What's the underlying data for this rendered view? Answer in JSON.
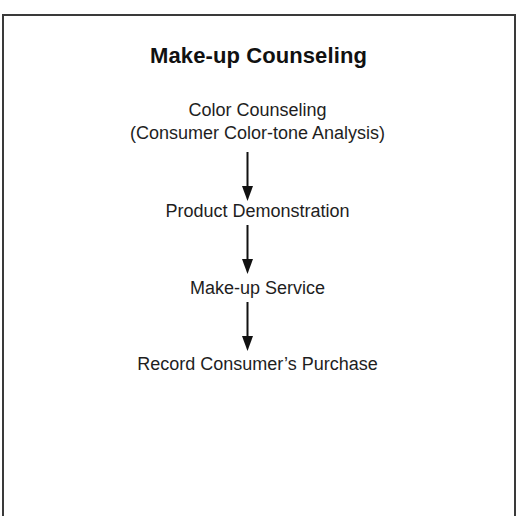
{
  "diagram": {
    "title": "Make-up Counseling",
    "steps": [
      {
        "lines": [
          "Color Counseling",
          "(Consumer Color-tone Analysis)"
        ]
      },
      {
        "lines": [
          "Product Demonstration"
        ]
      },
      {
        "lines": [
          "Make-up Service"
        ]
      },
      {
        "lines": [
          "Record Consumer’s Purchase"
        ]
      }
    ],
    "connectors": [
      {
        "from": 0,
        "to": 1,
        "direction": "down",
        "icon": "arrow-down-icon"
      },
      {
        "from": 1,
        "to": 2,
        "direction": "down",
        "icon": "arrow-down-icon"
      },
      {
        "from": 2,
        "to": 3,
        "direction": "down",
        "icon": "arrow-down-icon"
      }
    ],
    "colors": {
      "border": "#3a3a3a",
      "text": "#1e1e1e",
      "arrow": "#111111",
      "background": "#ffffff"
    }
  }
}
